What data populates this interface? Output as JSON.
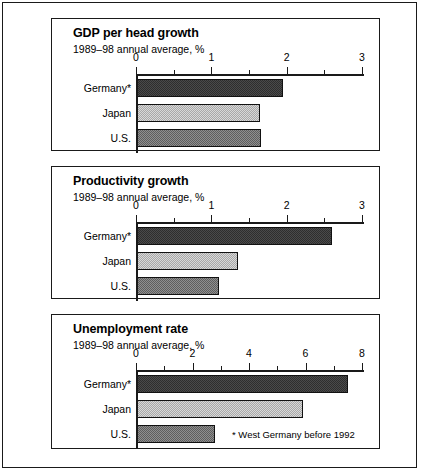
{
  "figure": {
    "footnote": "* West Germany before 1992"
  },
  "chart_data": [
    {
      "type": "bar",
      "orientation": "horizontal",
      "title": "GDP per head growth",
      "subtitle": "1989–98 annual average, %",
      "xlabel": "",
      "ylabel": "",
      "categories": [
        "Germany*",
        "Japan",
        "U.S."
      ],
      "values": [
        1.95,
        1.65,
        1.66
      ],
      "xlim": [
        0,
        3
      ],
      "xticks": [
        0,
        1,
        2,
        3
      ],
      "xtick_labels": [
        "0",
        "1",
        "2",
        "3"
      ],
      "minor_xticks": [
        0.5,
        1.5,
        2.5
      ],
      "grid": false,
      "legend": "none",
      "series_fills": [
        "dark",
        "light",
        "mid"
      ]
    },
    {
      "type": "bar",
      "orientation": "horizontal",
      "title": "Productivity growth",
      "subtitle": "1989–98 annual average, %",
      "xlabel": "",
      "ylabel": "",
      "categories": [
        "Germany*",
        "Japan",
        "U.S."
      ],
      "values": [
        2.6,
        1.35,
        1.1
      ],
      "xlim": [
        0,
        3
      ],
      "xticks": [
        0,
        1,
        2,
        3
      ],
      "xtick_labels": [
        "0",
        "1",
        "2",
        "3"
      ],
      "minor_xticks": [
        0.5,
        1.5,
        2.5
      ],
      "grid": false,
      "legend": "none",
      "series_fills": [
        "dark",
        "light",
        "mid"
      ]
    },
    {
      "type": "bar",
      "orientation": "horizontal",
      "title": "Unemployment rate",
      "subtitle": "1989–98 annual average, %",
      "xlabel": "",
      "ylabel": "",
      "categories": [
        "Germany*",
        "Japan",
        "U.S."
      ],
      "values": [
        7.5,
        5.9,
        2.8
      ],
      "xlim": [
        0,
        8
      ],
      "xticks": [
        0,
        2,
        4,
        6,
        8
      ],
      "xtick_labels": [
        "0",
        "2",
        "4",
        "6",
        "8"
      ],
      "minor_xticks": [
        1,
        3,
        5,
        7
      ],
      "grid": false,
      "legend": "none",
      "series_fills": [
        "dark",
        "light",
        "mid"
      ],
      "annotation": "* West Germany before 1992"
    }
  ]
}
